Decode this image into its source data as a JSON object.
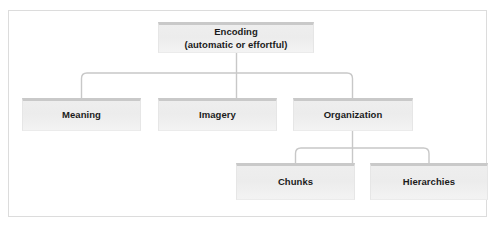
{
  "diagram": {
    "type": "hierarchy-tree",
    "orientation": "top-down",
    "frame": {
      "border_color": "#dcdcdc",
      "background": "#ffffff"
    },
    "node_style": {
      "fill_top": "#eeeeee",
      "fill_bottom": "#f3f3f3",
      "top_stripe_color": "#c9c9c9",
      "text_color": "#1b1b1b"
    },
    "connector_style": {
      "color": "#c8c8c8",
      "width_px": 1.4,
      "corner": "rounded"
    },
    "nodes": {
      "encoding": {
        "label": "Encoding",
        "sublabel": "(automatic or effortful)",
        "level": 1
      },
      "meaning": {
        "label": "Meaning",
        "level": 2
      },
      "imagery": {
        "label": "Imagery",
        "level": 2
      },
      "organization": {
        "label": "Organization",
        "level": 2
      },
      "chunks": {
        "label": "Chunks",
        "level": 3
      },
      "hierarchies": {
        "label": "Hierarchies",
        "level": 3
      }
    },
    "edges": [
      {
        "from": "encoding",
        "to": "meaning"
      },
      {
        "from": "encoding",
        "to": "imagery"
      },
      {
        "from": "encoding",
        "to": "organization"
      },
      {
        "from": "organization",
        "to": "chunks"
      },
      {
        "from": "organization",
        "to": "hierarchies"
      }
    ]
  }
}
